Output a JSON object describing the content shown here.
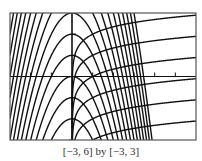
{
  "chart_data": {
    "type": "line",
    "title": "",
    "caption": "[−3, 6] by [−3, 3]",
    "xlabel": "",
    "ylabel": "",
    "xlim": [
      -3,
      6
    ],
    "ylim": [
      -3,
      3
    ],
    "grid": false,
    "legend": "none",
    "x_ticks": [
      -3,
      -2,
      -1,
      0,
      1,
      2,
      3,
      4,
      5,
      6
    ],
    "y_ticks": [
      -3,
      -2,
      -1,
      0,
      1,
      2,
      3
    ],
    "series": [
      {
        "name": "parabola family",
        "formula": "y = k - x^2",
        "domain": [
          -3,
          6
        ],
        "parameters": [
          -3,
          -2,
          -1,
          0,
          1,
          2,
          3,
          4,
          5,
          6,
          7,
          8,
          9,
          10,
          11,
          12
        ]
      },
      {
        "name": "logarithmic family (orthogonal trajectories)",
        "formula": "y = 0.5*ln(x) + c",
        "domain": [
          0.001,
          6
        ],
        "parameters": [
          -4,
          -3,
          -2,
          -1,
          0,
          1,
          2
        ]
      }
    ]
  },
  "style": {
    "curve_color": "#111111",
    "frame_color": "#555555",
    "axis_color": "#111111",
    "background": "#ffffff"
  },
  "frame": {
    "left": 10,
    "top": 13,
    "right": 196,
    "bottom": 140
  }
}
